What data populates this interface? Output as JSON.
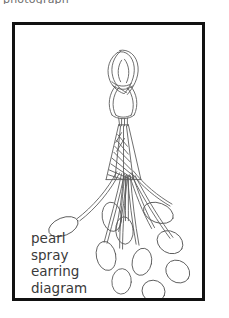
{
  "page": {
    "background_color": "#ffffff",
    "width": 229,
    "height": 318
  },
  "top_clipped_text": "photograph",
  "frame": {
    "border_color": "#111111",
    "fill_color": "#ffffff",
    "name": "picture-frame"
  },
  "artwork": {
    "title": "pearl spray earring diagram",
    "medium": "line drawing",
    "line_color": "#5a5a5a",
    "fill_color": "#ffffff",
    "parts": {
      "hook": "loop-knot-hook",
      "cone": "hatched-cone-cap",
      "strands": "fanning-strand-bundle",
      "pearls": "oval-pearl-drops"
    }
  },
  "caption": {
    "lines": [
      "pearl",
      "spray",
      "earring",
      "diagram"
    ],
    "line1": "pearl",
    "line2": "spray",
    "line3": "earring",
    "line4": "diagram",
    "color": "#3a3a3a"
  }
}
